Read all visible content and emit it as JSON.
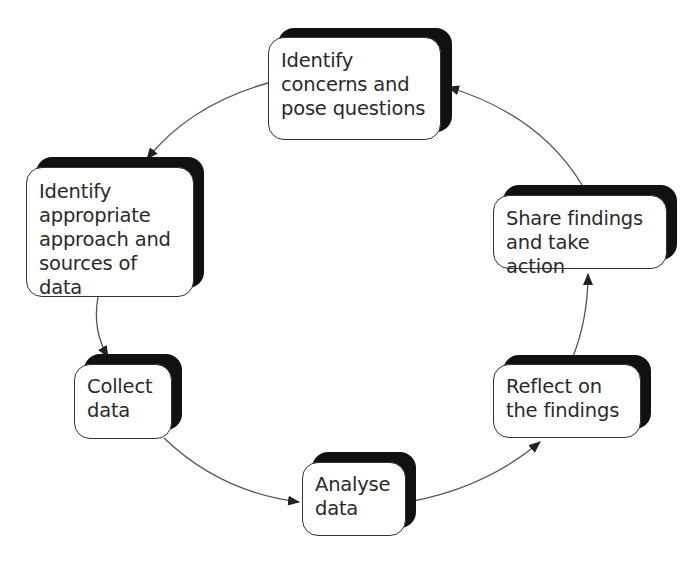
{
  "diagram": {
    "type": "cycle",
    "colors": {
      "box_fill": "#ffffff",
      "box_border": "#333333",
      "shadow": "#111111",
      "text": "#2a2a2a",
      "arrow": "#444444"
    },
    "nodes": [
      {
        "id": "identify-concerns",
        "label": "Identify concerns and pose questions",
        "lines": [
          "Identify",
          "concerns and",
          "pose questions"
        ]
      },
      {
        "id": "identify-approach",
        "label": "Identify appropriate approach and sources of data",
        "lines": [
          "Identify",
          "appropriate",
          "approach and",
          "sources of data"
        ]
      },
      {
        "id": "collect-data",
        "label": "Collect data",
        "lines": [
          "Collect",
          "data"
        ]
      },
      {
        "id": "analyse-data",
        "label": "Analyse data",
        "lines": [
          "Analyse",
          "data"
        ]
      },
      {
        "id": "reflect-findings",
        "label": "Reflect on the findings",
        "lines": [
          "Reflect on",
          "the findings"
        ]
      },
      {
        "id": "share-findings",
        "label": "Share findings and take action",
        "lines": [
          "Share findings",
          "and take action"
        ]
      }
    ],
    "edges": [
      {
        "from": "identify-concerns",
        "to": "identify-approach"
      },
      {
        "from": "identify-approach",
        "to": "collect-data"
      },
      {
        "from": "collect-data",
        "to": "analyse-data"
      },
      {
        "from": "analyse-data",
        "to": "reflect-findings"
      },
      {
        "from": "reflect-findings",
        "to": "share-findings"
      },
      {
        "from": "share-findings",
        "to": "identify-concerns"
      }
    ]
  }
}
